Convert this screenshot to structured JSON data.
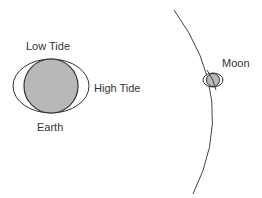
{
  "diagram": {
    "labels": {
      "low_tide": "Low Tide",
      "high_tide": "High Tide",
      "earth": "Earth",
      "moon": "Moon"
    },
    "colors": {
      "body_fill": "#b8b8b8",
      "stroke": "#333333",
      "background": "#ffffff"
    }
  }
}
